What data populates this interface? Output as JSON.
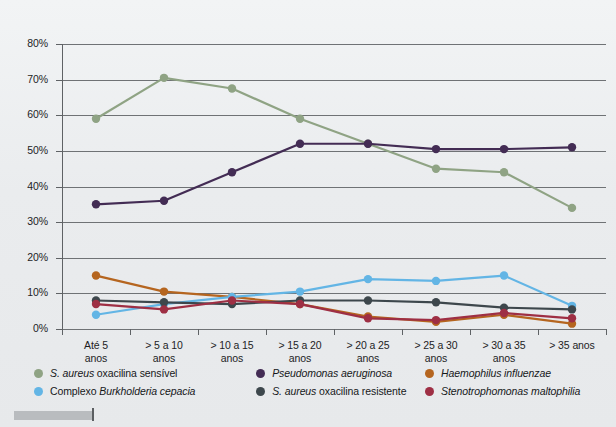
{
  "chart_data": {
    "type": "line",
    "title": "",
    "xlabel": "",
    "ylabel": "",
    "ylim": [
      0,
      80
    ],
    "ytick_labels": [
      "0%",
      "10%",
      "20%",
      "30%",
      "40%",
      "50%",
      "60%",
      "70%",
      "80%"
    ],
    "ytick_values": [
      0,
      10,
      20,
      30,
      40,
      50,
      60,
      70,
      80
    ],
    "grid": true,
    "legend_position": "bottom",
    "categories": [
      "Até 5 anos",
      "> 5 a 10 anos",
      "> 10 a 15 anos",
      "> 15 a 20 anos",
      "> 20 a 25 anos",
      "> 25 a 30 anos",
      "> 30 a 35 anos",
      "> 35 anos"
    ],
    "category_lines": [
      [
        "Até 5",
        "anos"
      ],
      [
        "> 5 a 10",
        "anos"
      ],
      [
        "> 10 a 15",
        "anos"
      ],
      [
        "> 15 a 20",
        "anos"
      ],
      [
        "> 20 a 25",
        "anos"
      ],
      [
        "> 25 a 30",
        "anos"
      ],
      [
        "> 30 a 35",
        "anos"
      ],
      [
        "> 35 anos",
        ""
      ]
    ],
    "series": [
      {
        "name": "S. aureus oxacilina sensível",
        "color": "#8fa384",
        "values": [
          59,
          70.5,
          67.5,
          59,
          52,
          45,
          44,
          34
        ]
      },
      {
        "name": "Pseudomonas aeruginosa",
        "color": "#432c54",
        "values": [
          35,
          36,
          44,
          52,
          52,
          50.5,
          50.5,
          51
        ]
      },
      {
        "name": "Haemophilus influenzae",
        "color": "#b5651f",
        "values": [
          15,
          10.5,
          9,
          7,
          3.5,
          2,
          4,
          1.5
        ]
      },
      {
        "name": "Complexo Burkholderia cepacia",
        "color": "#63b5e5",
        "values": [
          4,
          7,
          9,
          10.5,
          14,
          13.5,
          15,
          6.5
        ]
      },
      {
        "name": "S. aureus oxacilina resistente",
        "color": "#3d474c",
        "values": [
          8,
          7.5,
          7,
          8,
          8,
          7.5,
          6,
          5.5
        ]
      },
      {
        "name": "Stenotrophomonas maltophilia",
        "color": "#9e2f44",
        "values": [
          7,
          5.5,
          8,
          7,
          3,
          2.5,
          4.5,
          3
        ]
      }
    ]
  },
  "legend": {
    "entries": [
      {
        "prefix": "",
        "italic": "S. aureus",
        "suffix": " oxacilina sensível",
        "color": "#8fa384"
      },
      {
        "prefix": "",
        "italic": "Pseudomonas aeruginosa",
        "suffix": "",
        "color": "#432c54"
      },
      {
        "prefix": "",
        "italic": "Haemophilus influenzae",
        "suffix": "",
        "color": "#b5651f"
      },
      {
        "prefix": "Complexo ",
        "italic": "Burkholderia cepacia",
        "suffix": "",
        "color": "#63b5e5"
      },
      {
        "prefix": "",
        "italic": "S. aureus",
        "suffix": " oxacilina resistente",
        "color": "#3d474c"
      },
      {
        "prefix": "",
        "italic": "Stenotrophomonas maltophilia",
        "suffix": "",
        "color": "#9e2f44"
      }
    ]
  }
}
